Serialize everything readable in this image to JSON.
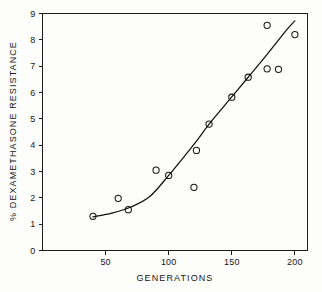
{
  "chart_data": {
    "type": "scatter",
    "title": "",
    "xlabel": "GENERATIONS",
    "ylabel": "% DEXAMETHASONE RESISTANCE",
    "xlim": [
      0,
      210
    ],
    "ylim": [
      0,
      9
    ],
    "xticks": [
      50,
      100,
      150,
      200
    ],
    "yticks": [
      0,
      1,
      2,
      3,
      4,
      5,
      6,
      7,
      8,
      9
    ],
    "xtick_labels": [
      "50",
      "100",
      "150",
      "200"
    ],
    "ytick_labels": [
      "0",
      "1",
      "2",
      "3",
      "4",
      "5",
      "6",
      "7",
      "8",
      "9"
    ],
    "grid": false,
    "legend": false,
    "marker": "open-circle",
    "points": [
      {
        "x": 40,
        "y": 1.3
      },
      {
        "x": 60,
        "y": 1.98
      },
      {
        "x": 68,
        "y": 1.55
      },
      {
        "x": 90,
        "y": 3.05
      },
      {
        "x": 100,
        "y": 2.85
      },
      {
        "x": 120,
        "y": 2.4
      },
      {
        "x": 122,
        "y": 3.8
      },
      {
        "x": 132,
        "y": 4.8
      },
      {
        "x": 150,
        "y": 5.82
      },
      {
        "x": 163,
        "y": 6.58
      },
      {
        "x": 178,
        "y": 8.55
      },
      {
        "x": 178,
        "y": 6.9
      },
      {
        "x": 187,
        "y": 6.88
      },
      {
        "x": 200,
        "y": 8.2
      }
    ],
    "fit_curve": [
      {
        "x": 40,
        "y": 1.28
      },
      {
        "x": 55,
        "y": 1.42
      },
      {
        "x": 70,
        "y": 1.65
      },
      {
        "x": 85,
        "y": 2.05
      },
      {
        "x": 100,
        "y": 2.85
      },
      {
        "x": 112,
        "y": 3.55
      },
      {
        "x": 122,
        "y": 4.15
      },
      {
        "x": 132,
        "y": 4.8
      },
      {
        "x": 145,
        "y": 5.55
      },
      {
        "x": 152,
        "y": 5.95
      },
      {
        "x": 163,
        "y": 6.58
      },
      {
        "x": 178,
        "y": 7.45
      },
      {
        "x": 193,
        "y": 8.35
      },
      {
        "x": 200,
        "y": 8.72
      }
    ]
  },
  "figure": {
    "background_color": "#fdfdfb",
    "ink_color": "#161616"
  }
}
